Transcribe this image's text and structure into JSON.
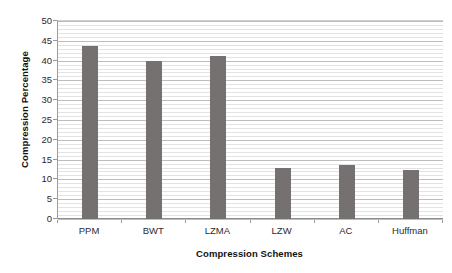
{
  "chart_data": {
    "type": "bar",
    "title": "",
    "xlabel": "Compression Schemes",
    "ylabel": "Compression Percentage",
    "categories": [
      "PPM",
      "BWT",
      "LZMA",
      "LZW",
      "AC",
      "Huffman"
    ],
    "values": [
      43.8,
      40.0,
      41.2,
      13.0,
      13.7,
      12.5
    ],
    "series": [
      {
        "name": "Compression Percentage",
        "values": [
          43.8,
          40.0,
          41.2,
          13.0,
          13.7,
          12.5
        ]
      }
    ],
    "ylim": [
      0,
      50
    ],
    "y_ticks": [
      0,
      5,
      10,
      15,
      20,
      25,
      30,
      35,
      40,
      45,
      50
    ],
    "y_tick_labels": [
      "0",
      "5",
      "10",
      "15",
      "20",
      "25",
      "30",
      "35",
      "40",
      "45",
      "50"
    ],
    "y_minor_tick_step": 1,
    "grid": true,
    "grid_axis": "y",
    "legend": false,
    "legend_position": "none",
    "bar_color": "#767171",
    "major_gridline_color": "#bdbdbd",
    "minor_gridline_color": "#e2e2e2",
    "axis_color": "#8e8e8e",
    "background_color": "#ffffff",
    "text_color": "#2b2b2b"
  }
}
